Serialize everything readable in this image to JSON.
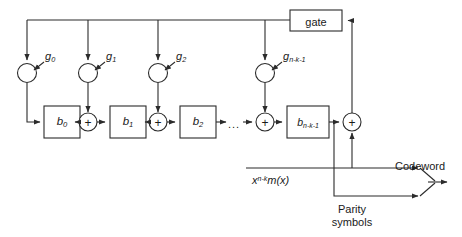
{
  "diagram": {
    "stroke_color": "#2b2b2b",
    "text_color": "#1a1a1a",
    "background": "#ffffff"
  },
  "gate": {
    "label": "gate"
  },
  "multipliers": [
    {
      "id": "g0",
      "base": "g",
      "sub": "0"
    },
    {
      "id": "g1",
      "base": "g",
      "sub": "1"
    },
    {
      "id": "g2",
      "base": "g",
      "sub": "2"
    },
    {
      "id": "gn",
      "base": "g",
      "sub": "n-k-1"
    }
  ],
  "registers": [
    {
      "id": "b0",
      "base": "b",
      "sub": "0"
    },
    {
      "id": "b1",
      "base": "b",
      "sub": "1"
    },
    {
      "id": "b2",
      "base": "b",
      "sub": "2"
    },
    {
      "id": "bn",
      "base": "b",
      "sub": "n-k-1"
    }
  ],
  "adders": {
    "symbol": "+",
    "count": 4
  },
  "ellipsis": {
    "text": "..."
  },
  "signals": {
    "input_base": "x",
    "input_sup": "n-k",
    "input_tail": "m(x)",
    "parity_line1": "Parity",
    "parity_line2": "symbols",
    "codeword": "Codeword"
  }
}
